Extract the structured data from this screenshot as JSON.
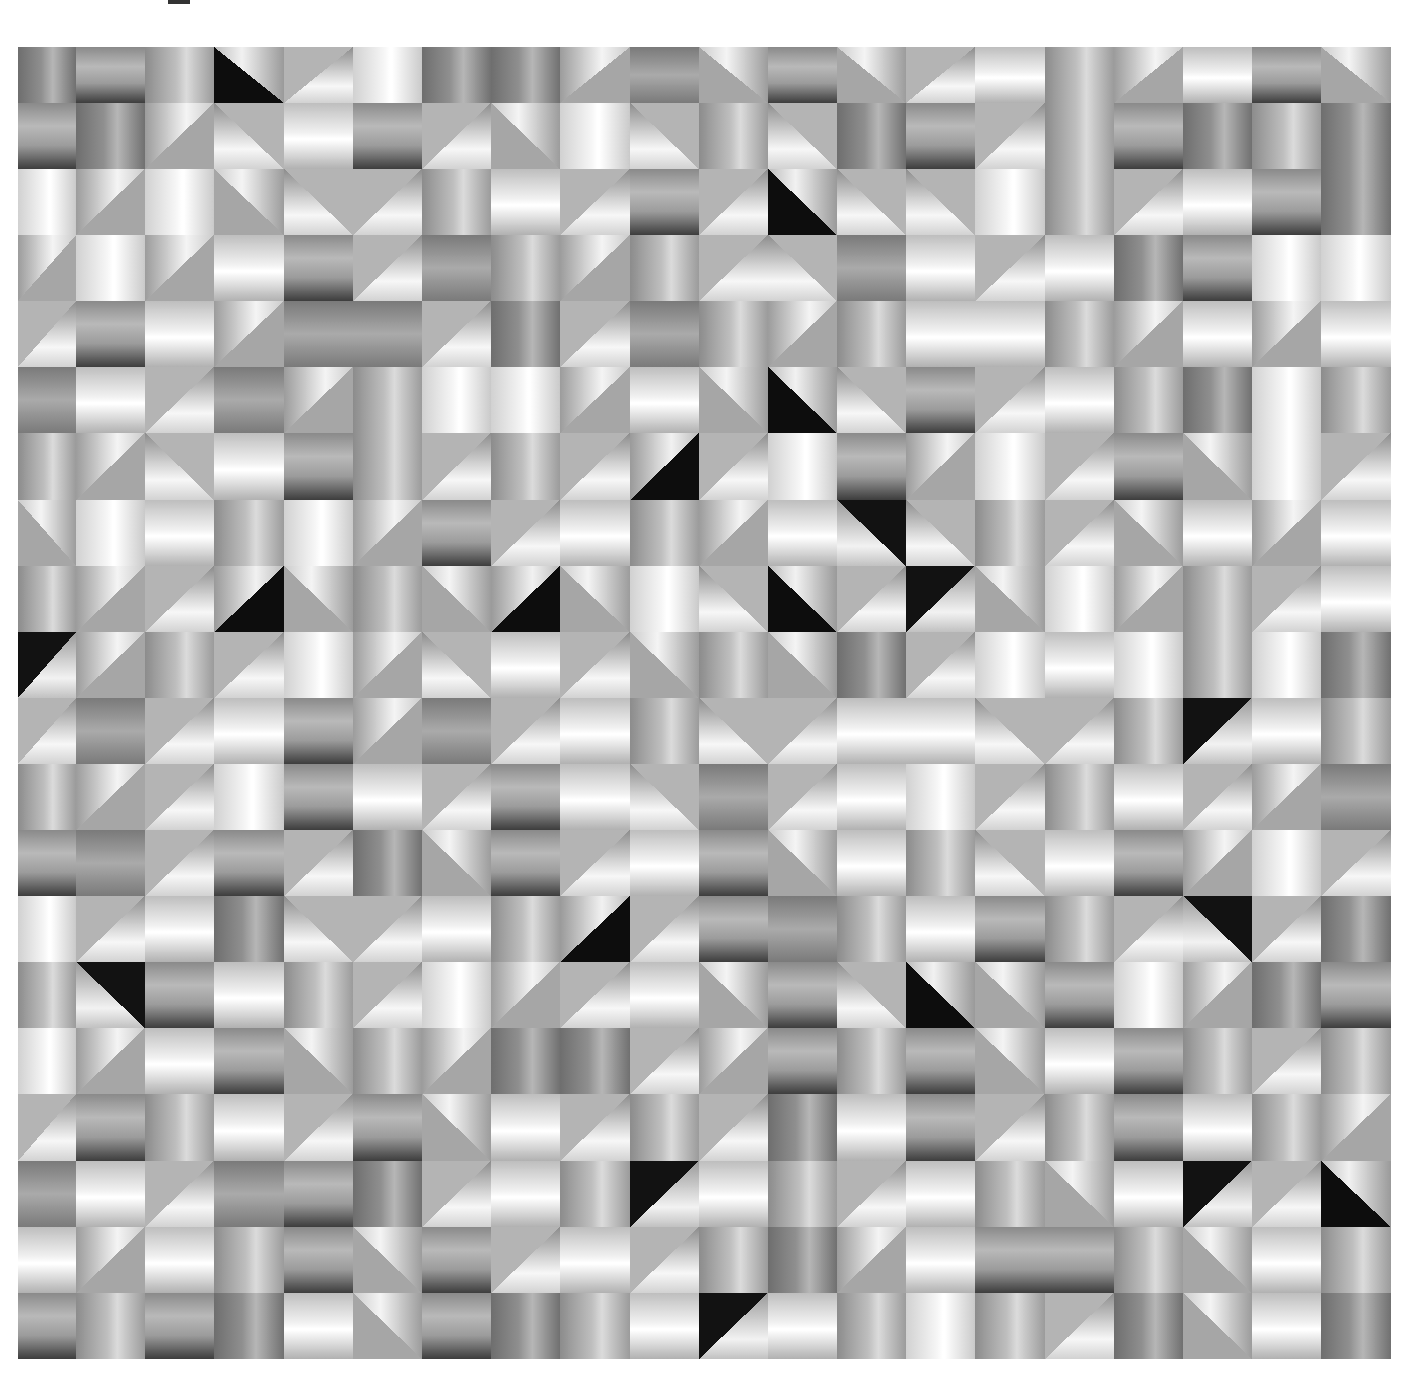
{
  "artwork": {
    "description": "Abstract op-art grid of grayscale gradient squares and diagonally split triangles",
    "columns": 20,
    "rows": 20,
    "palette": {
      "black": "#0f0f0f",
      "dark": "#3e3e3e",
      "mid": "#9a9a9a",
      "light": "#d9d9d9",
      "white": "#ffffff"
    },
    "legend": {
      "v": "vertical-gradient-mid",
      "V": "vertical-gradient-light",
      "w": "vertical-gradient-dark",
      "h": "horizontal-gradient-dark-bottom",
      "H": "horizontal-gradient-light",
      "g": "horizontal-gradient-gray",
      "1": "diagonal-split-up-left",
      "2": "diagonal-split-up-right",
      "3": "diagonal-split-down-right",
      "4": "diagonal-split-down-left",
      "a": "dark-triangle-up-left",
      "b": "dark-triangle-up-right",
      "c": "dark-triangle-down-right",
      "d": "dark-triangle-down-left"
    },
    "grid": [
      "whvb3V w1g2h23Hv1Hh2H",
      "hw14Hh32V4v4wh3vhwvw",
      "V1V243vH3h3b44Vv3Hhw",
      "1V1Hh3gv1v34gH3HwhVV",
      "3hH1gg3w3gv1vHHv1H1H",
      "gH3g1vVV1H2b4h3HvwVv",
      "v14Hhv3v3a3Vh1V3h2V3",
      "2VHvV1h3Hv1Hd4v32H1H",
      "v13a2v2a2V4b3c2V1v3H",
      "c1v3V14H32v2w3VHVvVw",
      "3g3Hh1g3Hv43HH43vcHv",
      "v13VhH3hH4g3HV3vH31g",
      "hg3h3w2h3Hh2Hv4Hh1V3",
      "V3Hw43Hva3hgvHhv3d3w",
      "vdhHv3V13H2h4b2hV1wh",
      "V1Hh2v1ww31hvh2Hhv3v",
      "3hvH3h2H3v3wHh3vhHv1",
      "gH3ghw3HvcHv3Hv2Hc3b",
      "H1Hvh2h3H3vw1Hhhv2Hv",
      "hvhwH2hwvHcHvVv3w2Hw"
    ]
  }
}
